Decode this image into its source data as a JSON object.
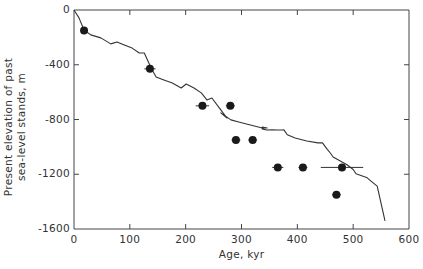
{
  "chart_data": {
    "type": "scatter",
    "title": "",
    "xlabel": "Age, kyr",
    "ylabel": "Present elevation of past sea-level stands, m",
    "ylabel_lines": [
      "Present elevation of past",
      "sea-level stands, m"
    ],
    "xlim": [
      0,
      600
    ],
    "ylim": [
      -1600,
      0
    ],
    "xticks": [
      0,
      100,
      200,
      300,
      400,
      500,
      600
    ],
    "xtick_labels": [
      "0",
      "100",
      "200",
      "300",
      "400",
      "500",
      "600"
    ],
    "yticks": [
      0,
      -400,
      -800,
      -1200,
      -1600
    ],
    "ytick_labels": [
      "0",
      "-400",
      "-800",
      "-1200",
      "-1600"
    ],
    "grid": false,
    "legend": null,
    "series": [
      {
        "name": "Sea-level stands (dated terraces)",
        "type": "scatter",
        "marker": "filled-circle",
        "points": [
          {
            "x": 18,
            "y": -150,
            "xerr": 3
          },
          {
            "x": 136,
            "y": -430,
            "xerr": 10
          },
          {
            "x": 230,
            "y": -700,
            "xerr": 12
          },
          {
            "x": 280,
            "y": -700,
            "xerr": 8
          },
          {
            "x": 290,
            "y": -950,
            "xerr": 8
          },
          {
            "x": 320,
            "y": -950,
            "xerr": 8
          },
          {
            "x": 365,
            "y": -1150,
            "xerr": 10
          },
          {
            "x": 410,
            "y": -1150,
            "xerr": 8
          },
          {
            "x": 480,
            "y": -1150,
            "xerr": 38
          },
          {
            "x": 470,
            "y": -1350,
            "xerr": 8
          }
        ]
      },
      {
        "name": "Modelled sea-level curve",
        "type": "line",
        "points": [
          [
            0,
            0
          ],
          [
            9,
            -58
          ],
          [
            18,
            -146
          ],
          [
            30,
            -182
          ],
          [
            48,
            -204
          ],
          [
            66,
            -248
          ],
          [
            77,
            -234
          ],
          [
            90,
            -256
          ],
          [
            104,
            -278
          ],
          [
            117,
            -314
          ],
          [
            126,
            -314
          ],
          [
            138,
            -424
          ],
          [
            147,
            -489
          ],
          [
            161,
            -511
          ],
          [
            176,
            -533
          ],
          [
            192,
            -570
          ],
          [
            201,
            -541
          ],
          [
            215,
            -570
          ],
          [
            228,
            -606
          ],
          [
            238,
            -657
          ],
          [
            247,
            -643
          ],
          [
            263,
            -730
          ],
          [
            274,
            -789
          ],
          [
            263,
            -752
          ],
          [
            281,
            -803
          ],
          [
            295,
            -818
          ],
          [
            316,
            -840
          ],
          [
            337,
            -862
          ],
          [
            346,
            -862
          ],
          [
            337,
            -855
          ],
          [
            337,
            -869
          ],
          [
            345,
            -877
          ],
          [
            355,
            -876
          ],
          [
            364,
            -877
          ],
          [
            373,
            -877
          ],
          [
            376,
            -876
          ],
          [
            382,
            -912
          ],
          [
            396,
            -935
          ],
          [
            417,
            -957
          ],
          [
            437,
            -971
          ],
          [
            445,
            -971
          ],
          [
            453,
            -1015
          ],
          [
            459,
            -1045
          ],
          [
            464,
            -1074
          ],
          [
            477,
            -1103
          ],
          [
            489,
            -1130
          ],
          [
            500,
            -1165
          ],
          [
            505,
            -1197
          ],
          [
            524,
            -1223
          ],
          [
            532,
            -1250
          ],
          [
            543,
            -1287
          ],
          [
            557,
            -1540
          ]
        ]
      }
    ]
  },
  "plot_px": {
    "left": 74,
    "right": 409,
    "top": 10,
    "bottom": 229
  }
}
